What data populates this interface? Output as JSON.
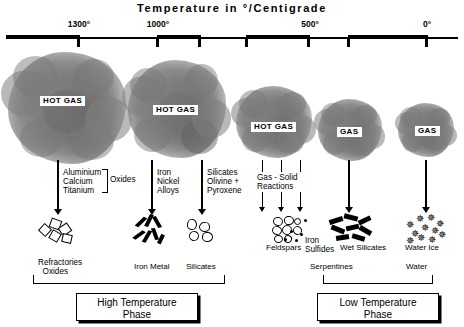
{
  "title": "Temperature in °/Centigrade",
  "axis": {
    "ticks": [
      {
        "label": "1300°",
        "x": 78,
        "labeled": true
      },
      {
        "label": "",
        "x": 155,
        "labeled": false
      },
      {
        "label": "1000°",
        "x": 157,
        "labeled": true
      },
      {
        "label": "500°",
        "x": 310,
        "labeled": true
      },
      {
        "label": "0°",
        "x": 425,
        "labeled": true
      }
    ],
    "tick_positions": [
      78,
      157,
      198,
      246,
      308,
      348,
      425
    ],
    "labels": [
      "1300°",
      "1000°",
      "500°",
      "0°"
    ],
    "label_positions": [
      78,
      157,
      310,
      425
    ]
  },
  "clouds": [
    {
      "name": "cloud-1",
      "label": "HOT GAS",
      "x": 8,
      "y": 54,
      "w": 118,
      "h": 110
    },
    {
      "name": "cloud-2",
      "label": "HOT GAS",
      "x": 128,
      "y": 62,
      "w": 96,
      "h": 94
    },
    {
      "name": "cloud-3",
      "label": "HOT GAS",
      "x": 235,
      "y": 88,
      "w": 76,
      "h": 68
    },
    {
      "name": "cloud-4",
      "label": "GAS",
      "x": 316,
      "y": 100,
      "w": 64,
      "h": 60
    },
    {
      "name": "cloud-5",
      "label": "GAS",
      "x": 395,
      "y": 104,
      "w": 58,
      "h": 54
    }
  ],
  "process_labels": [
    {
      "name": "aluminium-calcium-titanium",
      "text": "Aluminium\nCalcium\nTitanium",
      "x": 62,
      "y": 170
    },
    {
      "name": "oxides",
      "text": "Oxides",
      "x": 108,
      "y": 178
    },
    {
      "name": "iron-nickel-alloys",
      "text": "Iron\nNickel\nAlloys",
      "x": 157,
      "y": 170
    },
    {
      "name": "silicates-olivine-pyroxene",
      "text": "Silicates\nOlivine +\nPyroxene",
      "x": 207,
      "y": 170
    },
    {
      "name": "gas-solid-reactions",
      "text": "Gas - Solid\nReactions",
      "x": 258,
      "y": 174
    }
  ],
  "product_labels": [
    {
      "name": "feldspars",
      "text": "Feldspars",
      "x": 283,
      "y": 244
    },
    {
      "name": "iron-sulfides",
      "text": "Iron\nSulfides",
      "x": 320,
      "y": 238
    },
    {
      "name": "wet-silicates",
      "text": "Wet Silicates",
      "x": 371,
      "y": 244
    },
    {
      "name": "water-ice",
      "text": "Water Ice",
      "x": 428,
      "y": 244
    }
  ],
  "group_captions": [
    {
      "name": "refractories-oxides",
      "text": "Refractories\n  Oxides",
      "x": 66,
      "y": 258
    },
    {
      "name": "iron-metal",
      "text": "Iron Metal",
      "x": 165,
      "y": 262
    },
    {
      "name": "silicates",
      "text": "Silicates",
      "x": 218,
      "y": 262
    },
    {
      "name": "serpentines",
      "text": "Serpentines",
      "x": 332,
      "y": 262
    },
    {
      "name": "water",
      "text": "Water",
      "x": 425,
      "y": 262
    }
  ],
  "brackets": [
    {
      "name": "high-temperature-bracket",
      "x": 32,
      "y": 278,
      "w": 191
    },
    {
      "name": "low-temperature-bracket",
      "x": 322,
      "y": 278,
      "w": 109
    }
  ],
  "phase_boxes": [
    {
      "name": "high-temperature-phase",
      "text": "High Temperature\nPhase",
      "x": 76,
      "y": 292,
      "w": 120,
      "h": 29
    },
    {
      "name": "low-temperature-phase",
      "text": "Low Temperature\nPhase",
      "x": 317,
      "y": 292,
      "w": 120,
      "h": 29
    }
  ],
  "colors": {
    "ink": "#000000",
    "paper": "#ffffff",
    "cloud_gray": "#888888"
  }
}
